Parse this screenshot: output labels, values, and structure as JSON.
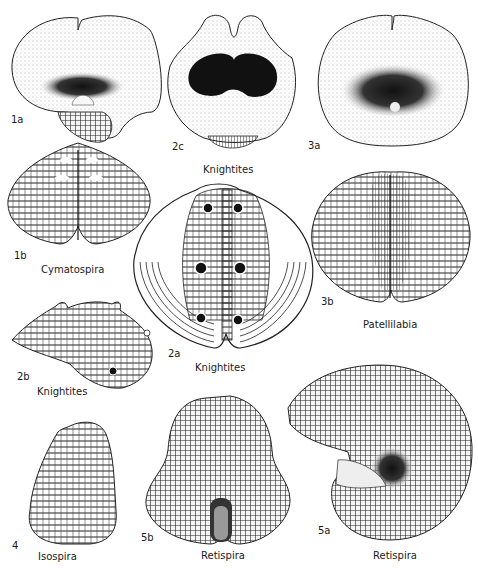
{
  "plate": {
    "figures": [
      {
        "id": "1a",
        "genus": "Cymatospira",
        "view": "apertural-top"
      },
      {
        "id": "1b",
        "genus": "Cymatospira",
        "view": "dorsal"
      },
      {
        "id": "2a",
        "genus": "Knightites",
        "view": "dorsal"
      },
      {
        "id": "2b",
        "genus": "Knightites",
        "view": "lateral"
      },
      {
        "id": "2c",
        "genus": "Knightites",
        "view": "apertural"
      },
      {
        "id": "3a",
        "genus": "Patellilabia",
        "view": "apertural"
      },
      {
        "id": "3b",
        "genus": "Patellilabia",
        "view": "dorsal"
      },
      {
        "id": "4",
        "genus": "Isospira",
        "view": "dorsal"
      },
      {
        "id": "5a",
        "genus": "Retispira",
        "view": "lateral"
      },
      {
        "id": "5b",
        "genus": "Retispira",
        "view": "apertural"
      }
    ],
    "labels": {
      "fig1a": "1a",
      "fig1b": "1b",
      "fig2a": "2a",
      "fig2b": "2b",
      "fig2c": "2c",
      "fig3a": "3a",
      "fig3b": "3b",
      "fig4": "4",
      "fig5a": "5a",
      "fig5b": "5b"
    },
    "names": {
      "cymatospira": "Cymatospira",
      "knightites_2c": "Knightites",
      "knightites_2a": "Knightites",
      "knightites_2b": "Knightites",
      "patellilabia": "Patellilabia",
      "isospira": "Isospira",
      "retispira_5b": "Retispira",
      "retispira_5a": "Retispira"
    }
  }
}
